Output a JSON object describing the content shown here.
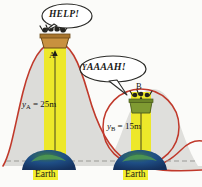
{
  "figure": {
    "background_color": "#fbfbf9",
    "hill_outline_color": "#c0392b",
    "hill_fill_color": "#dcdcd8",
    "beam_color": "#ede82a",
    "earth_dome_color": "#1f3f7a",
    "ground_line_color": "#9a9a95",
    "bubble_fill": "#ffffff",
    "bubble_stroke": "#2b2b28"
  },
  "bubbles": [
    {
      "id": "help",
      "text": "HELP!",
      "speaker": "A"
    },
    {
      "id": "yaaaah",
      "lead": "Y",
      "text": "AAAAH!",
      "speaker": "B"
    }
  ],
  "points": [
    {
      "id": "A",
      "label": "A",
      "height_symbol": "y",
      "height_subscript": "A",
      "height_value": "25",
      "height_unit": "m"
    },
    {
      "id": "B",
      "label": "B",
      "height_symbol": "y",
      "height_subscript": "B",
      "height_value": "15",
      "height_unit": "m"
    }
  ],
  "height_labels": {
    "a_full": "= 25m",
    "b_full": "= 15m"
  },
  "ground": {
    "left_label": "Earth",
    "right_label": "Earth"
  }
}
